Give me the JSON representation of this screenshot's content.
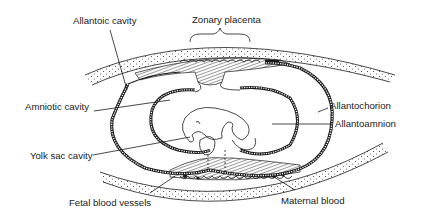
{
  "diagram": {
    "labels": {
      "allantoic_cavity": "Allantoic cavity",
      "zonary_placenta": "Zonary placenta",
      "amniotic_cavity": "Amniotic cavity",
      "allantochorion": "Allantochorion",
      "allantoamnion": "Allantoamnion",
      "yolk_sac_cavity": "Yolk sac cavity",
      "fetal_blood_vessels": "Fetal blood vessels",
      "maternal_blood": "Maternal blood"
    },
    "colors": {
      "ink": "#1a1a1a",
      "background": "#ffffff"
    }
  }
}
